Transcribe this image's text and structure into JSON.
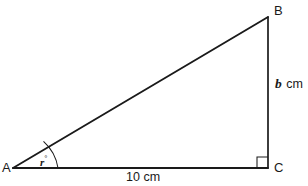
{
  "figure": {
    "type": "right-triangle-diagram",
    "background_color": "#ffffff",
    "stroke_color": "#1a1a1a"
  },
  "vertices": {
    "a": "A",
    "b": "B",
    "c": "C"
  },
  "sides": {
    "base_label": "10 cm",
    "base_value": "10",
    "base_unit": "cm",
    "vertical_var": "b",
    "vertical_unit": "cm"
  },
  "angle": {
    "variable": "r",
    "degree_symbol": "°",
    "at_vertex": "A"
  },
  "markers": {
    "right_angle_at": "C"
  }
}
